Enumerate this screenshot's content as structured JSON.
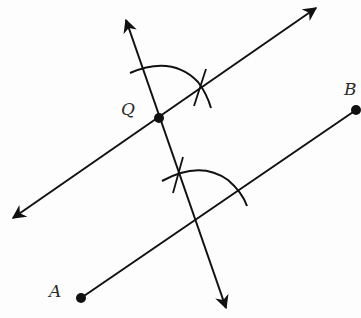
{
  "diagram": {
    "type": "geometric-construction",
    "colors": {
      "stroke": "#111111",
      "background": "#fdfdfd",
      "label": "#2a2a2a"
    },
    "points": {
      "A": {
        "label": "A",
        "x": 81,
        "y": 298
      },
      "B": {
        "label": "B",
        "x": 356,
        "y": 110
      },
      "Q": {
        "label": "Q",
        "x": 159,
        "y": 118
      }
    },
    "segment_AB": {
      "from": "A",
      "to": "B"
    },
    "transversal": {
      "start": [
        126,
        20
      ],
      "end": [
        226,
        308
      ],
      "arrows": "both"
    },
    "parallel_line": {
      "start": [
        13,
        218
      ],
      "end": [
        316,
        8
      ],
      "arrows": "both",
      "through": "Q"
    },
    "arcs": [
      {
        "name": "upper-arc",
        "center": "Q",
        "crossmark_at": [
          203,
          88
        ]
      },
      {
        "name": "lower-arc",
        "center": [
          195,
          222
        ],
        "crossmark_at": [
          176,
          172
        ]
      }
    ]
  }
}
